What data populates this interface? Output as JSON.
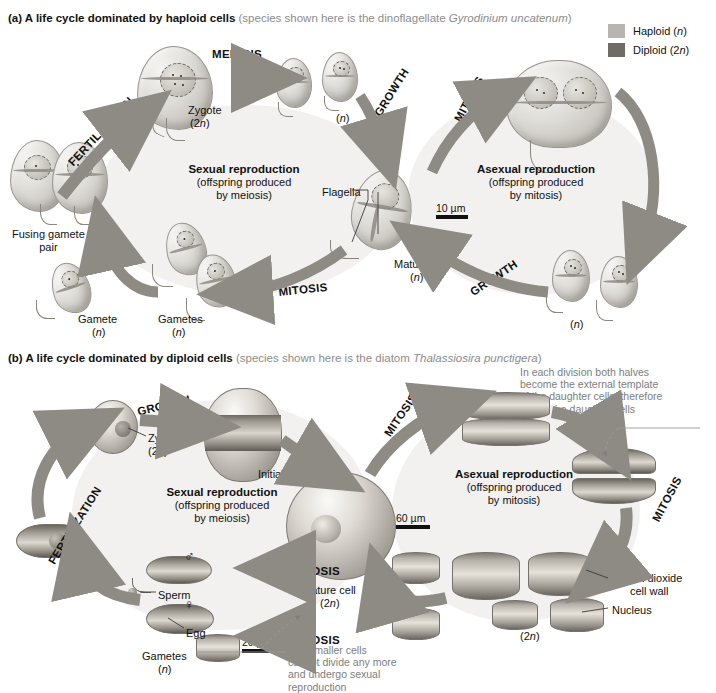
{
  "colors": {
    "haploid": "#b9b5ae",
    "diploid": "#6f6b65",
    "arrow": "#8e8a84",
    "arrow_dark": "#5d5952",
    "disc_bg": "#f2f1ef",
    "note_text": "#7d7d7d"
  },
  "legend": {
    "items": [
      {
        "label": "Haploid (n)",
        "swatch": "#b9b5ae",
        "name": "haploid"
      },
      {
        "label": "Diploid (2n)",
        "swatch": "#6f6b65",
        "name": "diploid"
      }
    ]
  },
  "panel_a": {
    "key": "(a)",
    "title": "A life cycle dominated by haploid cells",
    "subtitle_pre": "(species shown here is the dinoflagellate ",
    "subtitle_italic": "Gyrodinium uncatenum",
    "subtitle_post": ")",
    "sexual_heading": "Sexual reproduction",
    "sexual_line2": "(offspring produced",
    "sexual_line3": "by meiosis)",
    "asexual_heading": "Asexual reproduction",
    "asexual_line2": "(offspring produced",
    "asexual_line3": "by mitosis)",
    "stages": {
      "fertilization": "FERTILIZATION",
      "meiosis": "MEIOSIS",
      "growth_top": "GROWTH",
      "mitosis_top": "MITOSIS",
      "growth_bottom": "GROWTH",
      "mitosis_bottom": "MITOSIS"
    },
    "labels": {
      "zygote": "Zygote",
      "zygote_ploidy": "(2n)",
      "meiosis_products_ploidy": "(n)",
      "fusing_gamete_l1": "Fusing gamete",
      "fusing_gamete_l2": "pair",
      "gamete": "Gamete",
      "gamete_ploidy": "(n)",
      "gametes": "Gametes",
      "gametes_ploidy": "(n)",
      "flagella": "Flagella",
      "mature_cell": "Mature cell",
      "mature_cell_ploidy": "(n)",
      "daughters_ploidy": "(n)"
    },
    "scalebar": "10 µm"
  },
  "panel_b": {
    "key": "(b)",
    "title": "A life cycle dominated by diploid cells",
    "subtitle_pre": "(species shown here is the diatom ",
    "subtitle_italic": "Thalassiosira punctigera",
    "subtitle_post": ")",
    "sexual_heading": "Sexual reproduction",
    "sexual_line2": "(offspring produced",
    "sexual_line3": "by meiosis)",
    "asexual_heading": "Asexual reproduction",
    "asexual_line2": "(offspring produced",
    "asexual_line3": "by mitosis)",
    "stages": {
      "growth": "GROWTH",
      "mitosis_top": "MITOSIS",
      "mitosis_right": "MITOSIS",
      "meiosis_upper": "MEIOSIS",
      "meiosis_lower": "MEIOSIS",
      "fertilization": "FERTILIZATION"
    },
    "labels": {
      "zygote": "Zygote",
      "zygote_ploidy": "(2n)",
      "initial_cell": "Initial cell",
      "mature_cell": "Mature cell",
      "mature_cell_ploidy": "(2n)",
      "silicon_l1": "Silicon dioxide",
      "silicon_l2": "cell wall",
      "nucleus": "Nucleus",
      "daughters_ploidy": "(2n)",
      "sperm": "Sperm",
      "egg": "Egg",
      "gametes": "Gametes",
      "gametes_ploidy": "(n)",
      "male_symbol": "♂",
      "female_symbol": "♀"
    },
    "notes": {
      "division_note": [
        "In each division both halves",
        "become the external template",
        "of the daughter cells, therefore",
        "one of the daughter cells",
        "will be smaller"
      ],
      "smaller_cells_note": [
        "The smaller cells",
        "cannot divide any more",
        "and undergo sexual",
        "reproduction"
      ]
    },
    "scalebar_mature": "60 µm",
    "scalebar_gamete": "20 µm"
  }
}
